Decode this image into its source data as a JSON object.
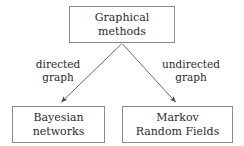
{
  "diagram": {
    "nodes": [
      {
        "id": "root",
        "line1": "Graphical",
        "line2": "methods"
      },
      {
        "id": "bayesian",
        "line1": "Bayesian",
        "line2": "networks"
      },
      {
        "id": "markov",
        "line1": "Markov",
        "line2": "Random Fields"
      }
    ],
    "edges": [
      {
        "id": "left",
        "label_line1": "directed",
        "label_line2": "graph",
        "from": "root",
        "to": "bayesian"
      },
      {
        "id": "right",
        "label_line1": "undirected",
        "label_line2": "graph",
        "from": "root",
        "to": "markov"
      }
    ],
    "colors": {
      "box_border": "#8a8a8a",
      "text": "#2b2b2b",
      "arrow": "#555555",
      "background": "#ffffff"
    }
  }
}
